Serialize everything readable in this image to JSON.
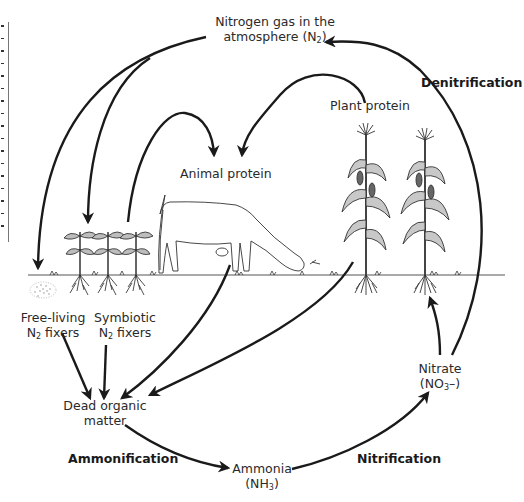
{
  "diagram": {
    "nodes": {
      "atmosphere": {
        "line1": "Nitrogen gas in the",
        "line2_text": "atmosphere (N",
        "line2_sub": "2",
        "line2_end": ")"
      },
      "plant_protein": {
        "label": "Plant protein"
      },
      "animal_protein": {
        "label": "Animal protein"
      },
      "free_living": {
        "line1": "Free-living",
        "line2_pre": "N",
        "line2_sub": "2",
        "line2_end": " fixers"
      },
      "symbiotic": {
        "line1": "Symbiotic",
        "line2_pre": "N",
        "line2_sub": "2",
        "line2_end": " fixers"
      },
      "dead_organic": {
        "line1": "Dead organic",
        "line2": "matter"
      },
      "ammonia": {
        "line1": "Ammonia",
        "line2_pre": "(NH",
        "line2_sub": "3",
        "line2_end": ")"
      },
      "nitrate": {
        "line1": "Nitrate",
        "line2_pre": "(NO",
        "line2_sub": "3",
        "line2_end": "–)"
      }
    },
    "processes": {
      "denitrification": "Denitrification",
      "ammonification": "Ammonification",
      "nitrification": "Nitrification"
    },
    "illustrations": [
      "legume plants with root nodules",
      "grazing cow",
      "corn plants",
      "soil bacteria cluster",
      "ground line"
    ],
    "edges": [
      {
        "from": "atmosphere",
        "to": "free_living"
      },
      {
        "from": "atmosphere",
        "to": "symbiotic"
      },
      {
        "from": "symbiotic",
        "to": "animal_protein"
      },
      {
        "from": "plant_protein",
        "to": "animal_protein"
      },
      {
        "from": "free_living",
        "to": "dead_organic"
      },
      {
        "from": "symbiotic",
        "to": "dead_organic"
      },
      {
        "from": "animal_protein",
        "to": "dead_organic"
      },
      {
        "from": "plant_protein",
        "to": "dead_organic"
      },
      {
        "from": "dead_organic",
        "to": "ammonia",
        "label": "Ammonification"
      },
      {
        "from": "ammonia",
        "to": "nitrate",
        "label": "Nitrification"
      },
      {
        "from": "nitrate",
        "to": "plant_protein"
      },
      {
        "from": "nitrate",
        "to": "atmosphere",
        "label": "Denitrification"
      }
    ],
    "colors": {
      "ink": "#1a1a1a",
      "text": "#2a2a2a",
      "ground": "#555555",
      "background": "#ffffff"
    }
  }
}
